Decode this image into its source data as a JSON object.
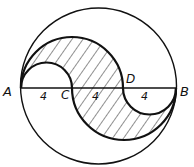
{
  "diagram": {
    "points": {
      "A": "A",
      "B": "B",
      "C": "C",
      "D": "D"
    },
    "segments": [
      {
        "label": "4",
        "from": "A",
        "to": "C"
      },
      {
        "label": "4",
        "from": "C",
        "to": "D"
      },
      {
        "label": "4",
        "from": "D",
        "to": "B"
      }
    ],
    "colors": {
      "stroke": "#111111",
      "background": "#ffffff",
      "hatch": "#222222"
    }
  }
}
